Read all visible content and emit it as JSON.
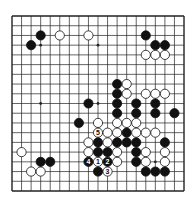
{
  "board": {
    "size": 19,
    "origin": {
      "x": 12,
      "y": 16
    },
    "spacing": {
      "x": 9.556,
      "y": 9.722
    },
    "colors": {
      "line": "#222222",
      "background": "#ffffff",
      "black": "#111111",
      "white": "#ffffff"
    },
    "star_points": [
      [
        3,
        3
      ],
      [
        9,
        3
      ],
      [
        15,
        3
      ],
      [
        3,
        9
      ],
      [
        9,
        9
      ],
      [
        15,
        9
      ],
      [
        3,
        15
      ],
      [
        9,
        15
      ],
      [
        15,
        15
      ]
    ],
    "stones": [
      {
        "c": 3,
        "r": 2,
        "color": "black"
      },
      {
        "c": 2,
        "r": 3,
        "color": "black"
      },
      {
        "c": 5,
        "r": 2,
        "color": "white"
      },
      {
        "c": 8,
        "r": 2,
        "color": "white"
      },
      {
        "c": 14,
        "r": 2,
        "color": "black"
      },
      {
        "c": 15,
        "r": 3,
        "color": "black"
      },
      {
        "c": 16,
        "r": 3,
        "color": "black"
      },
      {
        "c": 14,
        "r": 4,
        "color": "white"
      },
      {
        "c": 15,
        "r": 4,
        "color": "white"
      },
      {
        "c": 16,
        "r": 4,
        "color": "white"
      },
      {
        "c": 11,
        "r": 7,
        "color": "black"
      },
      {
        "c": 12,
        "r": 7,
        "color": "white"
      },
      {
        "c": 11,
        "r": 8,
        "color": "black"
      },
      {
        "c": 12,
        "r": 8,
        "color": "white"
      },
      {
        "c": 14,
        "r": 8,
        "color": "white"
      },
      {
        "c": 15,
        "r": 8,
        "color": "white"
      },
      {
        "c": 16,
        "r": 8,
        "color": "white"
      },
      {
        "c": 8,
        "r": 9,
        "color": "black"
      },
      {
        "c": 11,
        "r": 9,
        "color": "black"
      },
      {
        "c": 13,
        "r": 9,
        "color": "black"
      },
      {
        "c": 15,
        "r": 9,
        "color": "black"
      },
      {
        "c": 11,
        "r": 10,
        "color": "black"
      },
      {
        "c": 13,
        "r": 10,
        "color": "black"
      },
      {
        "c": 15,
        "r": 10,
        "color": "black"
      },
      {
        "c": 17,
        "r": 10,
        "color": "black"
      },
      {
        "c": 7,
        "r": 11,
        "color": "black"
      },
      {
        "c": 9,
        "r": 11,
        "color": "white"
      },
      {
        "c": 11,
        "r": 11,
        "color": "white"
      },
      {
        "c": 12,
        "r": 11,
        "color": "white"
      },
      {
        "c": 13,
        "r": 11,
        "color": "white"
      },
      {
        "c": 9,
        "r": 12,
        "color": "white",
        "label": "5"
      },
      {
        "c": 10,
        "r": 12,
        "color": "white"
      },
      {
        "c": 11,
        "r": 12,
        "color": "white"
      },
      {
        "c": 12,
        "r": 12,
        "color": "black"
      },
      {
        "c": 13,
        "r": 12,
        "color": "white"
      },
      {
        "c": 14,
        "r": 12,
        "color": "white"
      },
      {
        "c": 15,
        "r": 12,
        "color": "white"
      },
      {
        "c": 8,
        "r": 13,
        "color": "white"
      },
      {
        "c": 9,
        "r": 13,
        "color": "black"
      },
      {
        "c": 10,
        "r": 13,
        "color": "white"
      },
      {
        "c": 11,
        "r": 13,
        "color": "black"
      },
      {
        "c": 12,
        "r": 13,
        "color": "black"
      },
      {
        "c": 13,
        "r": 13,
        "color": "black"
      },
      {
        "c": 16,
        "r": 13,
        "color": "black"
      },
      {
        "c": 8,
        "r": 14,
        "color": "white"
      },
      {
        "c": 9,
        "r": 14,
        "color": "black"
      },
      {
        "c": 10,
        "r": 14,
        "color": "black"
      },
      {
        "c": 11,
        "r": 14,
        "color": "white"
      },
      {
        "c": 13,
        "r": 14,
        "color": "black"
      },
      {
        "c": 14,
        "r": 14,
        "color": "white"
      },
      {
        "c": 16,
        "r": 14,
        "color": "white"
      },
      {
        "c": 1,
        "r": 14,
        "color": "white"
      },
      {
        "c": 3,
        "r": 15,
        "color": "black"
      },
      {
        "c": 4,
        "r": 15,
        "color": "black"
      },
      {
        "c": 8,
        "r": 15,
        "color": "black",
        "label": "4"
      },
      {
        "c": 9,
        "r": 15,
        "color": "white",
        "label": "1"
      },
      {
        "c": 10,
        "r": 15,
        "color": "black",
        "label": "2"
      },
      {
        "c": 11,
        "r": 15,
        "color": "white"
      },
      {
        "c": 13,
        "r": 15,
        "color": "black"
      },
      {
        "c": 14,
        "r": 15,
        "color": "white"
      },
      {
        "c": 16,
        "r": 15,
        "color": "white"
      },
      {
        "c": 2,
        "r": 16,
        "color": "white"
      },
      {
        "c": 3,
        "r": 16,
        "color": "white"
      },
      {
        "c": 9,
        "r": 16,
        "color": "black"
      },
      {
        "c": 10,
        "r": 16,
        "color": "white",
        "label": "3"
      },
      {
        "c": 14,
        "r": 16,
        "color": "black"
      },
      {
        "c": 15,
        "r": 16,
        "color": "black"
      },
      {
        "c": 16,
        "r": 16,
        "color": "black"
      }
    ]
  }
}
